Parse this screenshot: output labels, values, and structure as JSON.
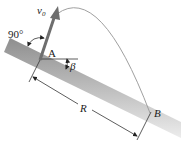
{
  "diagram": {
    "labels": {
      "velocity": "v",
      "velocity_sub": "0",
      "angle_launch": "90°",
      "point_a": "A",
      "angle_incline": "β",
      "range": "R",
      "point_b": "B"
    },
    "colors": {
      "incline_dark": "#8a8a8a",
      "incline_light": "#e6e6e6",
      "arrow": "#6e6e6e",
      "trajectory": "#9a9a9a",
      "lines": "#333333"
    }
  }
}
